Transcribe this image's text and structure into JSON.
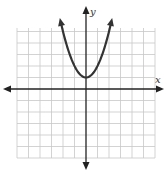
{
  "chart_data": {
    "type": "line",
    "title": "",
    "xlabel": "x",
    "ylabel": "y",
    "xlim": [
      -6,
      6
    ],
    "ylim": [
      -6,
      5.5
    ],
    "grid": true,
    "tick_labels": false,
    "series": [
      {
        "name": "parabola",
        "equation": "y = x^2 + 1",
        "vertex": [
          0,
          1
        ],
        "x_range": [
          -2.2,
          2.2
        ],
        "arrows_at_ends": true
      }
    ],
    "colors": {
      "grid": "#c8c8c8",
      "axis": "#222222",
      "curve": "#333333"
    }
  }
}
